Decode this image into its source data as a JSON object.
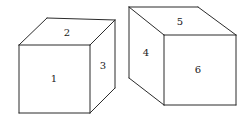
{
  "figure": {
    "background_color": "#ffffff",
    "line_color": "#2b2b2b",
    "label_color": "#1a1a1a",
    "canvas": {
      "width": 248,
      "height": 125
    },
    "objects": [
      {
        "name": "left-cube",
        "orientation": "front face lower-left; top and right faces visible",
        "faces": [
          {
            "label": "1",
            "face": "front",
            "polygon": "19,45 90,45 90,113 19,113",
            "label_x": 54,
            "label_y": 79
          },
          {
            "label": "2",
            "face": "top",
            "polygon": "19,45 47,18 115,20 90,45",
            "label_x": 67,
            "label_y": 33
          },
          {
            "label": "3",
            "face": "right",
            "polygon": "90,45 115,20 115,88 90,113",
            "label_x": 103,
            "label_y": 66
          }
        ],
        "edges": [
          "19,45 90,45",
          "90,45 90,113",
          "90,113 19,113",
          "19,113 19,45",
          "19,45 47,18",
          "47,18 115,20",
          "115,20 90,45",
          "115,20 115,88",
          "115,88 90,113"
        ]
      },
      {
        "name": "right-cube",
        "orientation": "front face lower-right; top and left faces visible",
        "faces": [
          {
            "label": "6",
            "face": "front",
            "polygon": "164,35 236,35 236,105 164,105",
            "label_x": 198,
            "label_y": 70
          },
          {
            "label": "5",
            "face": "top",
            "polygon": "164,35 129,7 198,7 236,35",
            "label_x": 180,
            "label_y": 22
          },
          {
            "label": "4",
            "face": "left",
            "polygon": "129,7 164,35 164,105 129,78",
            "label_x": 146,
            "label_y": 53
          }
        ],
        "edges": [
          "164,35 236,35",
          "236,35 236,105",
          "236,105 164,105",
          "164,105 164,35",
          "164,35 129,7",
          "129,7 198,7",
          "198,7 236,35",
          "129,7 129,78",
          "129,78 164,105"
        ]
      }
    ]
  }
}
